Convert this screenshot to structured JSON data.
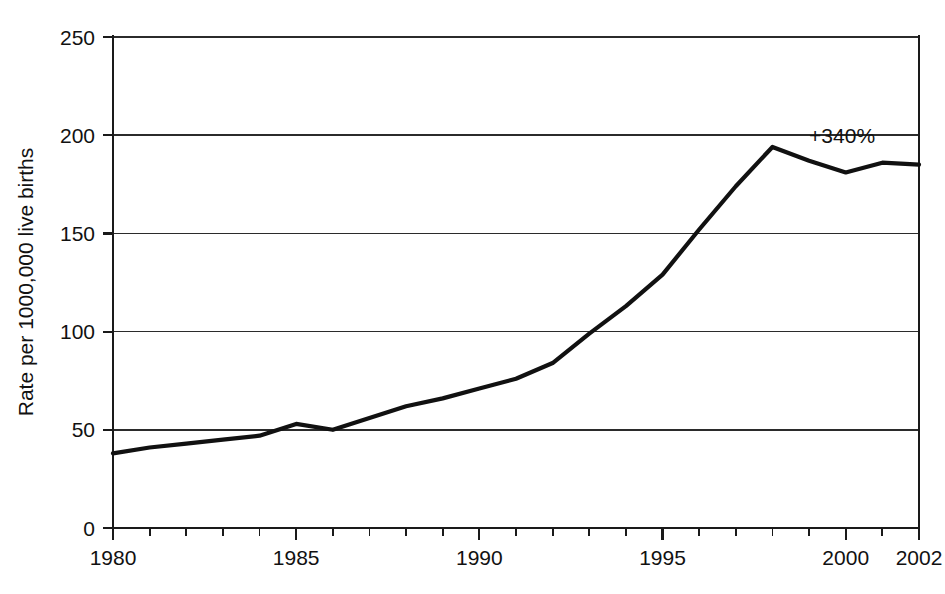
{
  "chart_data": {
    "type": "line",
    "title": "",
    "subtitle": "",
    "xlabel": "",
    "ylabel": "Rate per 1000,000 live births",
    "xlim": [
      1980,
      2002
    ],
    "ylim": [
      0,
      250
    ],
    "grid": "horizontal",
    "legend": "none",
    "y_ticks": [
      0,
      50,
      100,
      150,
      200,
      250
    ],
    "y_tick_labels": [
      "0",
      "50",
      "100",
      "150",
      "200",
      "250"
    ],
    "x_ticks": [
      1980,
      1981,
      1982,
      1983,
      1984,
      1985,
      1986,
      1987,
      1988,
      1989,
      1990,
      1991,
      1992,
      1993,
      1994,
      1995,
      1996,
      1997,
      1998,
      1999,
      2000,
      2001,
      2002
    ],
    "x_tick_labels": [
      "1980",
      "1985",
      "1990",
      "1995",
      "2000",
      "2002"
    ],
    "x_labeled_ticks": [
      1980,
      1985,
      1990,
      1995,
      2000,
      2002
    ],
    "x": [
      1980,
      1981,
      1982,
      1983,
      1984,
      1985,
      1986,
      1987,
      1988,
      1989,
      1990,
      1991,
      1992,
      1993,
      1994,
      1995,
      1996,
      1997,
      1998,
      1999,
      2000,
      2001,
      2002
    ],
    "values": [
      38,
      41,
      43,
      45,
      47,
      53,
      50,
      56,
      62,
      66,
      71,
      76,
      84,
      99,
      113,
      129,
      152,
      174,
      194,
      187,
      181,
      186,
      185
    ],
    "series": [
      {
        "name": "Rate per 1000,000 live births",
        "color": "#111111",
        "values": [
          38,
          41,
          43,
          45,
          47,
          53,
          50,
          56,
          62,
          66,
          71,
          76,
          84,
          99,
          113,
          129,
          152,
          174,
          194,
          187,
          181,
          186,
          185
        ]
      }
    ],
    "annotations": [
      {
        "text": "+340%",
        "x": 1999.0,
        "y": 196
      }
    ]
  },
  "axis": {
    "y_label": "Rate per 1000,000 live births"
  },
  "annotation": {
    "change_label": "+340%"
  },
  "colors": {
    "line": "#111111",
    "grid": "#2b2b2b",
    "axis": "#1a1a1a",
    "background": "#ffffff",
    "text": "#111111"
  }
}
